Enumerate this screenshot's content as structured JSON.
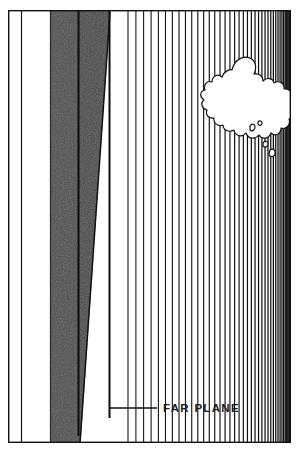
{
  "figure": {
    "background_color": "#ffffff",
    "line_color": "#111111",
    "band_fill_color": "#4d4d4d",
    "band_fill_color_dark": "#454545",
    "text_color": "#1a1a1a",
    "frame": {
      "name": "outer-frame",
      "x": 8,
      "y": 10,
      "width": 283,
      "height": 433,
      "stroke_width": 1.4
    },
    "labels": [
      {
        "id": "far-plane",
        "text": "FAR PLANE",
        "x": 163,
        "y": 412,
        "leader_line": {
          "from_x": 110,
          "from_y": 408,
          "to_x": 157,
          "to_y": 408
        }
      }
    ],
    "vertical_rules": [
      {
        "name": "inner-left-rule",
        "x": 21
      },
      {
        "name": "band-left-edge",
        "x": 50
      },
      {
        "name": "band-mid-rule",
        "x": 78
      },
      {
        "name": "band-right-edge",
        "x": 110
      }
    ],
    "gray_band": {
      "name": "near-plane-band",
      "left": 50,
      "right": 110,
      "top": 10,
      "bottom": 443
    },
    "diagonal": {
      "name": "far-plane-edge",
      "from_x": 110,
      "from_y": 14,
      "to_x": 80,
      "to_y": 443
    },
    "perspective_lines": {
      "name": "receding-vertical-lines",
      "count": 44,
      "start_x": 128,
      "vanishing_x": 292,
      "bottom_y": 443,
      "description": "vertical rules from the diagonal down to the baseline, spacing compresses toward the right"
    },
    "blob": {
      "name": "cloud-outline",
      "description": "irregular organic outline overlapping the upper right region",
      "holes": 4
    }
  }
}
